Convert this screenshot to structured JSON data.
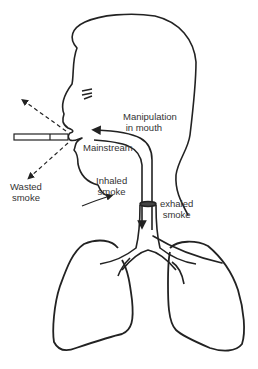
{
  "diagram": {
    "labels": {
      "manipulation": "Manipulation\n in mouth",
      "mainstream": "Mainstream",
      "wasted_smoke": "Wasted\nsmoke",
      "inhaled_smoke": "Inhaled\nsmoke",
      "exhaled_smoke": "exhaled\nsmoke"
    },
    "elements": [
      "head-profile",
      "cigarette",
      "wasted-smoke-arrows",
      "mainstream-arrow",
      "inhaled-arrow",
      "exhaled-path",
      "trachea",
      "bronchi",
      "left-lung",
      "right-lung"
    ],
    "colors": {
      "line": "#222222",
      "text": "#333333",
      "background": "#ffffff"
    }
  }
}
